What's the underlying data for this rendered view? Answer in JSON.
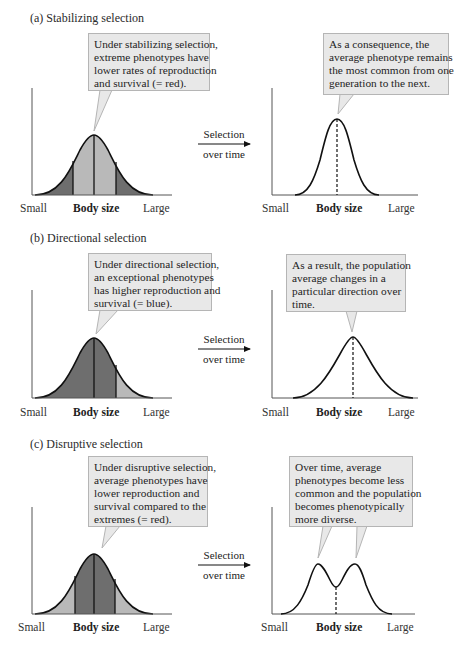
{
  "panels": [
    {
      "id": "a",
      "title": "(a) Stabilizing selection",
      "left_callout": [
        "Under stabilizing selection,",
        "extreme phenotypes have",
        "lower rates of reproduction",
        "and survival (= red)."
      ],
      "right_callout": [
        "As a consequence, the",
        "average phenotype remains",
        "the most common from one",
        "generation to the next."
      ],
      "arrow_top": "Selection",
      "arrow_bottom": "over time",
      "axis": {
        "left": "Small",
        "center": "Body size",
        "right": "Large"
      }
    },
    {
      "id": "b",
      "title": "(b) Directional selection",
      "left_callout": [
        "Under directional selection,",
        "an exceptional phenotypes",
        "has higher reproduction and",
        "survival (= blue)."
      ],
      "right_callout": [
        "As a result, the population",
        "average changes in a",
        "particular direction over",
        "time."
      ],
      "arrow_top": "Selection",
      "arrow_bottom": "over time",
      "axis": {
        "left": "Small",
        "center": "Body size",
        "right": "Large"
      }
    },
    {
      "id": "c",
      "title": "(c) Disruptive selection",
      "left_callout": [
        "Under disruptive selection,",
        "average phenotypes have",
        "lower reproduction and",
        "survival compared to the",
        "extremes (= red)."
      ],
      "right_callout": [
        "Over time, average",
        "phenotypes become less",
        "common and the population",
        "becomes phenotypically",
        "more diverse."
      ],
      "arrow_top": "Selection",
      "arrow_bottom": "over time",
      "axis": {
        "left": "Small",
        "center": "Body size",
        "right": "Large"
      }
    }
  ],
  "colors": {
    "dark_fill": "#6e6e6e",
    "light_fill": "#b9b9b9",
    "callout_bg": "#e8e8e8",
    "callout_border": "#b5b5b5",
    "line": "#111111"
  }
}
